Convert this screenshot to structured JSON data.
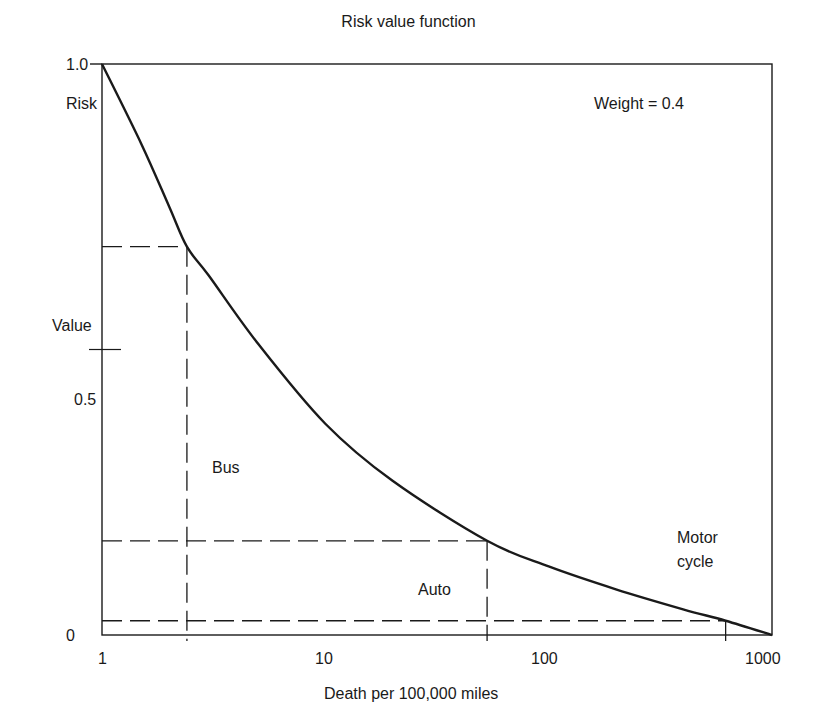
{
  "chart_data": {
    "type": "line",
    "title": "Risk value function",
    "xlabel": "Death per 100,000 miles",
    "ylabel": "Risk Value",
    "ylabel_lines": [
      "Risk",
      "Value"
    ],
    "x_scale": "log",
    "xlim": [
      1,
      1000
    ],
    "ylim": [
      0,
      1.0
    ],
    "x_ticks": [
      "1",
      "10",
      "100",
      "1000"
    ],
    "y_ticks": [
      "0",
      "0.5",
      "1.0"
    ],
    "grid": false,
    "annotation": "Weight = 0.4",
    "series": [
      {
        "name": "Risk value function",
        "x": [
          1,
          1.5,
          2,
          2.4,
          3,
          5,
          10,
          20,
          53,
          100,
          200,
          400,
          620,
          1000
        ],
        "y": [
          1.0,
          0.86,
          0.75,
          0.68,
          0.63,
          0.51,
          0.37,
          0.27,
          0.165,
          0.12,
          0.08,
          0.045,
          0.025,
          0.0
        ]
      }
    ],
    "reference_points": [
      {
        "label": "Bus",
        "x": 2.4,
        "y": 0.68
      },
      {
        "label": "Auto",
        "x": 53,
        "y": 0.165
      },
      {
        "label": "Motor cycle",
        "label_lines": [
          "Motor",
          "cycle"
        ],
        "x": 620,
        "y": 0.025
      }
    ]
  },
  "colors": {
    "line": "#1a1a1a",
    "background": "#ffffff"
  }
}
